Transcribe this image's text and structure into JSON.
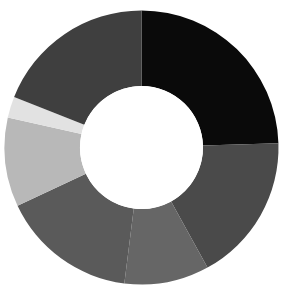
{
  "figure": {
    "background_color": "#ffffff",
    "width": 286,
    "height": 301
  },
  "chart_data": {
    "type": "pie",
    "variant": "donut",
    "title": "",
    "subtitle": "",
    "xlabel": "",
    "ylabel": "",
    "grid": false,
    "legend": "none",
    "labels_shown": false,
    "start_angle_deg": -90,
    "direction": "clockwise",
    "center": {
      "x": 141.5,
      "y": 147.5
    },
    "outer_radius": 137,
    "inner_radius": 61.5,
    "hole_color": "#ffffff",
    "categories": [
      "Segment 1",
      "Segment 2",
      "Segment 3",
      "Segment 4",
      "Segment 5",
      "Segment 6",
      "Segment 7"
    ],
    "values": [
      24.5,
      17.5,
      10.0,
      16.0,
      10.5,
      2.5,
      19.0
    ],
    "colors": [
      "#0a0a0a",
      "#4a4a4a",
      "#666666",
      "#5a5a5a",
      "#b8b8b8",
      "#e2e2e2",
      "#3f3f3f"
    ],
    "segments": [
      {
        "label": "Segment 1",
        "value": 24.5,
        "color": "#0a0a0a",
        "start_deg": 0.0,
        "end_deg": 88.2
      },
      {
        "label": "Segment 2",
        "value": 17.5,
        "color": "#4a4a4a",
        "start_deg": 88.2,
        "end_deg": 151.2
      },
      {
        "label": "Segment 3",
        "value": 10.0,
        "color": "#666666",
        "start_deg": 151.2,
        "end_deg": 187.2
      },
      {
        "label": "Segment 4",
        "value": 16.0,
        "color": "#5a5a5a",
        "start_deg": 187.2,
        "end_deg": 244.8
      },
      {
        "label": "Segment 5",
        "value": 10.5,
        "color": "#b8b8b8",
        "start_deg": 244.8,
        "end_deg": 282.6
      },
      {
        "label": "Segment 6",
        "value": 2.5,
        "color": "#e2e2e2",
        "start_deg": 282.6,
        "end_deg": 291.6
      },
      {
        "label": "Segment 7",
        "value": 19.0,
        "color": "#3f3f3f",
        "start_deg": 291.6,
        "end_deg": 360.0
      }
    ]
  }
}
